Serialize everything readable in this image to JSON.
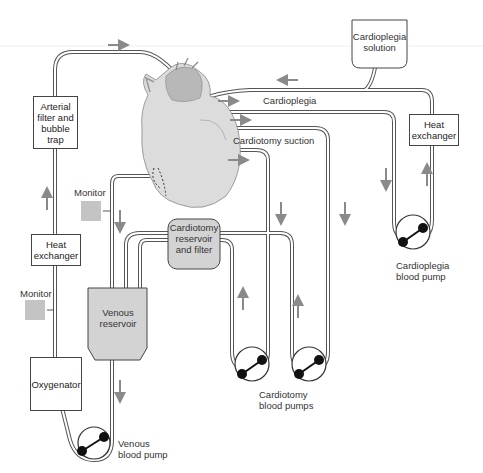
{
  "diagram": {
    "colors": {
      "tubing": "#555555",
      "arrow": "#8a8a8a",
      "reservoir_fill": "#d3d3d3",
      "monitor_fill": "#c4c4c4",
      "heart_fill": "#d9d9d9",
      "pump_roller": "#111111"
    },
    "components": {
      "arterial_filter": "Arterial filter and bubble trap",
      "arterial_filter_lines": [
        "Arterial",
        "filter and",
        "bubble",
        "trap"
      ],
      "heat_exchanger_left_lines": [
        "Heat",
        "exchanger"
      ],
      "heat_exchanger_right_lines": [
        "Heat",
        "exchanger"
      ],
      "oxygenator": "Oxygenator",
      "venous_reservoir_lines": [
        "Venous",
        "reservoir"
      ],
      "cardiotomy_reservoir_lines": [
        "Cardiotomy",
        "reservoir",
        "and filter"
      ],
      "cardioplegia_solution_lines": [
        "Cardioplegia",
        "solution"
      ],
      "monitor_upper": "Monitor",
      "monitor_lower": "Monitor"
    },
    "line_labels": {
      "cardioplegia": "Cardioplegia",
      "cardiotomy_suction": "Cardiotomy suction"
    },
    "pump_labels": {
      "venous_lines": [
        "Venous",
        "blood pump"
      ],
      "cardiotomy_lines": [
        "Cardiotomy",
        "blood pumps"
      ],
      "cardioplegia_lines": [
        "Cardioplegia",
        "blood pump"
      ]
    },
    "icons": {
      "heart": "heart-illustration",
      "pump": "roller-pump-icon",
      "arrow": "flow-arrow-icon",
      "monitor": "monitor-square-icon"
    }
  }
}
